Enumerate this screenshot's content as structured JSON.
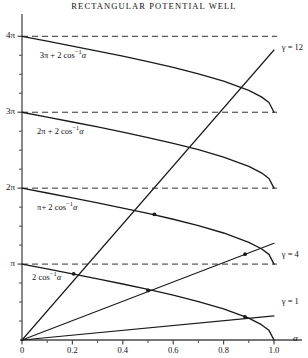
{
  "chart_data": {
    "type": "line",
    "title": "RECTANGULAR  POTENTIAL  WELL",
    "xlabel": "α",
    "ylabel": "",
    "xlim": [
      0,
      1.08
    ],
    "ylim": [
      0,
      13.2
    ],
    "grid": false,
    "xticks": [
      0,
      0.2,
      0.4,
      0.6,
      0.8,
      1.0
    ],
    "xticklabels": [
      "0",
      "0.2",
      "0.4",
      "0.6",
      "0.8",
      "1.0"
    ],
    "yticks": [
      3.14159,
      6.28319,
      9.42478,
      12.56637
    ],
    "yticklabels": [
      "π",
      "2π",
      "3π",
      "4π"
    ],
    "yminorticks": [
      0.7854,
      1.5708,
      2.3562,
      3.927,
      4.712,
      5.498,
      7.069,
      7.854,
      8.639,
      10.21,
      10.996,
      11.781
    ],
    "hlines": [
      {
        "y": 3.14159,
        "label": "π",
        "style": "dashed"
      },
      {
        "y": 6.28319,
        "label": "2π",
        "style": "dashed"
      },
      {
        "y": 9.42478,
        "label": "3π",
        "style": "dashed"
      },
      {
        "y": 12.56637,
        "label": "4π",
        "style": "dashed"
      }
    ],
    "series": [
      {
        "name": "2 cos^-1 alpha",
        "kind": "branch",
        "offset": 0,
        "label": "2 cos⁻¹α",
        "label_at": [
          0.04,
          2.55
        ],
        "points": [
          [
            0,
            3.1416
          ],
          [
            0.1,
            2.9412
          ],
          [
            0.2,
            2.7389
          ],
          [
            0.3,
            2.5322
          ],
          [
            0.4,
            2.3186
          ],
          [
            0.5,
            2.0944
          ],
          [
            0.6,
            1.8546
          ],
          [
            0.7,
            1.5908
          ],
          [
            0.8,
            1.287
          ],
          [
            0.9,
            0.9021
          ],
          [
            0.95,
            0.634
          ],
          [
            0.98,
            0.4003
          ],
          [
            1.0,
            0.0
          ]
        ]
      },
      {
        "name": "pi + 2 cos^-1 alpha",
        "kind": "branch",
        "offset": 3.14159,
        "label": "π+ 2 cos⁻¹α",
        "label_at": [
          0.06,
          5.45
        ],
        "points": [
          [
            0,
            6.2832
          ],
          [
            0.1,
            6.0828
          ],
          [
            0.2,
            5.8805
          ],
          [
            0.3,
            5.6738
          ],
          [
            0.4,
            5.4602
          ],
          [
            0.5,
            5.236
          ],
          [
            0.6,
            4.9962
          ],
          [
            0.7,
            4.7324
          ],
          [
            0.8,
            4.4286
          ],
          [
            0.9,
            4.0437
          ],
          [
            0.95,
            3.7756
          ],
          [
            0.98,
            3.5419
          ],
          [
            1.0,
            3.1416
          ]
        ]
      },
      {
        "name": "2pi + 2 cos^-1 alpha",
        "kind": "branch",
        "offset": 6.28319,
        "label": "2π + 2 cos⁻¹α",
        "label_at": [
          0.06,
          8.6
        ],
        "points": [
          [
            0,
            9.4248
          ],
          [
            0.1,
            9.2244
          ],
          [
            0.2,
            9.0221
          ],
          [
            0.3,
            8.8154
          ],
          [
            0.4,
            8.6018
          ],
          [
            0.5,
            8.3776
          ],
          [
            0.6,
            8.1378
          ],
          [
            0.7,
            7.874
          ],
          [
            0.8,
            7.5702
          ],
          [
            0.9,
            7.1853
          ],
          [
            0.95,
            6.9172
          ],
          [
            0.98,
            6.6835
          ],
          [
            1.0,
            6.2832
          ]
        ]
      },
      {
        "name": "3pi + 2 cos^-1 alpha",
        "kind": "branch",
        "offset": 9.42478,
        "label": "3π + 2 cos⁻¹α",
        "label_at": [
          0.07,
          11.75
        ],
        "points": [
          [
            0,
            12.5664
          ],
          [
            0.1,
            12.366
          ],
          [
            0.2,
            12.1637
          ],
          [
            0.3,
            11.957
          ],
          [
            0.4,
            11.7434
          ],
          [
            0.5,
            11.5192
          ],
          [
            0.6,
            11.2794
          ],
          [
            0.7,
            11.0156
          ],
          [
            0.8,
            10.7118
          ],
          [
            0.9,
            10.3269
          ],
          [
            0.95,
            10.0588
          ],
          [
            0.98,
            9.8251
          ],
          [
            1.0,
            9.4248
          ]
        ]
      },
      {
        "name": "gamma = 1",
        "kind": "ray",
        "gamma": 1,
        "label": "γ = 1",
        "label_at": [
          1.015,
          1.58
        ],
        "points": [
          [
            0,
            0
          ],
          [
            1.0,
            1.0
          ]
        ]
      },
      {
        "name": "gamma = 4",
        "kind": "ray",
        "gamma": 4,
        "label": "γ = 4",
        "label_at": [
          1.015,
          3.5
        ],
        "points": [
          [
            0,
            0
          ],
          [
            1.0,
            4.0
          ]
        ]
      },
      {
        "name": "gamma = 12",
        "kind": "ray",
        "gamma": 12,
        "label": "γ = 12",
        "label_at": [
          1.015,
          12.1
        ],
        "points": [
          [
            0,
            0
          ],
          [
            1.0,
            12.0
          ]
        ]
      }
    ],
    "intersections": [
      [
        0.205,
        2.74
      ],
      [
        0.5,
        2.05
      ],
      [
        0.885,
        0.96
      ],
      [
        0.525,
        5.2
      ],
      [
        0.885,
        3.55
      ]
    ],
    "annotations": [
      {
        "text": "γ = 12",
        "at": [
          1.015,
          12.1
        ]
      },
      {
        "text": "γ = 4",
        "at": [
          1.015,
          3.5
        ]
      },
      {
        "text": "γ = 1",
        "at": [
          1.015,
          1.58
        ]
      }
    ]
  },
  "axes": {
    "x_axis_name": "α",
    "x_labels": [
      "0",
      "0.2",
      "0.4",
      "0.6",
      "0.8",
      "1.0"
    ],
    "y_labels": [
      "π",
      "2π",
      "3π",
      "4π"
    ]
  },
  "title": "RECTANGULAR  POTENTIAL  WELL",
  "curve_labels": {
    "c0": "2 cos",
    "c1": "π+ 2 cos",
    "c2": "2π + 2 cos",
    "c3": "3π + 2 cos",
    "sup": "−1",
    "arg": "α"
  },
  "gamma_labels": {
    "g12": "γ = 12",
    "g4": "γ = 4",
    "g1": "γ = 1"
  },
  "colors": {
    "ink": "#1a1a1a",
    "axis": "#4a4a4a",
    "background": "#ffffff"
  }
}
